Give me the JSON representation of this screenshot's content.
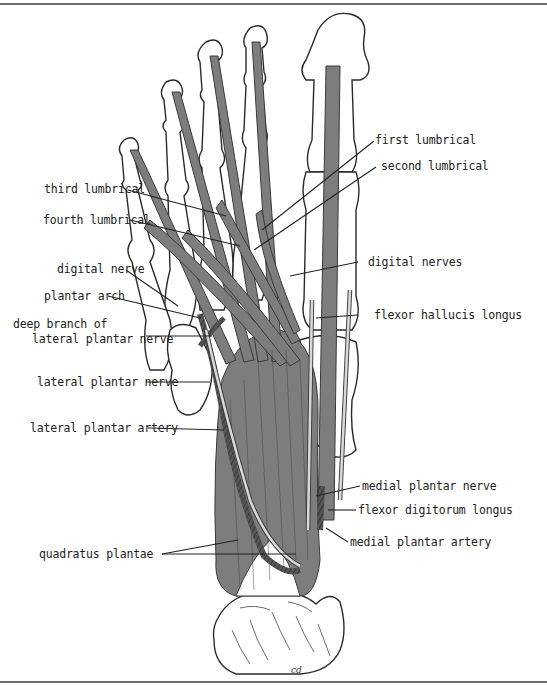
{
  "figure": {
    "colors": {
      "muscle": "#7d7d7d",
      "muscle_stroke": "#3a3a3a",
      "bone": "#ffffff",
      "bone_stroke": "#2a2a2a",
      "nerve": "#d8d8d8",
      "artery": "#555555",
      "leader": "#222222",
      "frame": "#6a6a6a"
    },
    "signature": "cd"
  },
  "labels": {
    "left": [
      {
        "id": "third-lumbrical",
        "text": "third lumbrical"
      },
      {
        "id": "fourth-lumbrical",
        "text": "fourth lumbrical"
      },
      {
        "id": "digital-nerve",
        "text": "digital nerve"
      },
      {
        "id": "plantar-arch",
        "text": "plantar arch"
      },
      {
        "id": "deep-branch-line1",
        "text": "deep branch of"
      },
      {
        "id": "deep-branch-line2",
        "text": "lateral plantar nerve"
      },
      {
        "id": "lateral-plantar-nerve",
        "text": "lateral plantar nerve"
      },
      {
        "id": "lateral-plantar-artery",
        "text": "lateral plantar artery"
      },
      {
        "id": "quadratus-plantae",
        "text": "quadratus plantae"
      }
    ],
    "right": [
      {
        "id": "first-lumbrical",
        "text": "first lumbrical"
      },
      {
        "id": "second-lumbrical",
        "text": "second lumbrical"
      },
      {
        "id": "digital-nerves",
        "text": "digital nerves"
      },
      {
        "id": "flexor-hallucis-longus",
        "text": "flexor hallucis longus"
      },
      {
        "id": "medial-plantar-nerve",
        "text": "medial plantar nerve"
      },
      {
        "id": "flexor-digitorum-longus",
        "text": "flexor digitorum longus"
      },
      {
        "id": "medial-plantar-artery",
        "text": "medial plantar artery"
      }
    ]
  }
}
